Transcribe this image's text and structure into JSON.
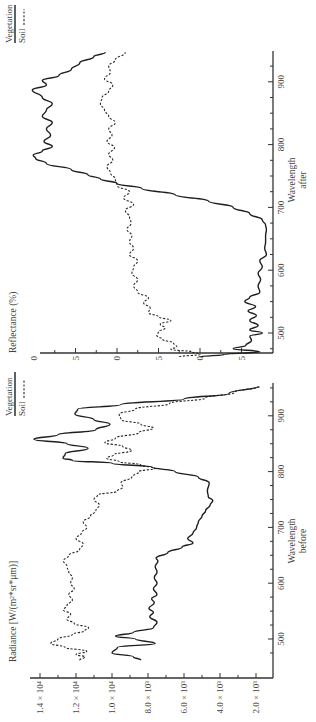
{
  "chart_data": [
    {
      "type": "line",
      "id": "before",
      "title": "",
      "xlabel": "Wavelength",
      "xlabel_sub": "before",
      "ylabel": "Radiance [W/(m²*sr*μm)]",
      "xlim": [
        460,
        955
      ],
      "ylim": [
        800,
        15000
      ],
      "xticks": [
        500,
        600,
        700,
        800,
        900
      ],
      "yticks": [
        2000,
        4000,
        6000,
        8000,
        10000,
        12000,
        14000
      ],
      "ytick_labels": [
        "2.0 × 10³",
        "4.0 × 10³",
        "6.0 × 10³",
        "8.0 × 10³",
        "1.0 × 10⁴",
        "1.2 × 10⁴",
        "1.4 × 10⁴"
      ],
      "legend": [
        {
          "name": "Vegetation",
          "style": "solid"
        },
        {
          "name": "Soil",
          "style": "dashed"
        }
      ],
      "series": [
        {
          "name": "Vegetation",
          "style": "solid",
          "x": [
            462,
            468,
            475,
            485,
            492,
            500,
            505,
            512,
            520,
            530,
            540,
            548,
            555,
            565,
            572,
            580,
            590,
            600,
            610,
            620,
            630,
            640,
            645,
            655,
            665,
            672,
            680,
            690,
            700,
            710,
            720,
            730,
            740,
            748,
            755,
            765,
            780,
            790,
            800,
            808,
            815,
            820,
            824,
            832,
            842,
            850,
            858,
            866,
            875,
            885,
            893,
            903,
            912,
            920,
            930,
            940,
            953
          ],
          "y": [
            8400,
            8800,
            10000,
            9700,
            7600,
            8700,
            9800,
            8800,
            7700,
            7500,
            7900,
            7700,
            7950,
            7650,
            7800,
            7500,
            7700,
            7500,
            7650,
            7500,
            7600,
            7450,
            7550,
            6900,
            6100,
            5500,
            5800,
            5500,
            5300,
            5200,
            5000,
            4800,
            4550,
            4400,
            4650,
            4700,
            4600,
            5200,
            6500,
            7800,
            10000,
            12200,
            12720,
            12600,
            11330,
            12500,
            14340,
            13000,
            10900,
            10110,
            11000,
            12060,
            11900,
            9500,
            6000,
            3500,
            1880
          ]
        },
        {
          "name": "Soil",
          "style": "dashed",
          "x": [
            462,
            468,
            472,
            478,
            485,
            492,
            500,
            508,
            515,
            520,
            528,
            535,
            545,
            552,
            560,
            570,
            580,
            590,
            600,
            610,
            620,
            630,
            640,
            650,
            660,
            670,
            680,
            690,
            700,
            710,
            720,
            730,
            740,
            750,
            758,
            765,
            772,
            780,
            790,
            800,
            806,
            812,
            818,
            824,
            830,
            838,
            845,
            852,
            860,
            870,
            878,
            885,
            893,
            903,
            912,
            922,
            932,
            942,
            953
          ],
          "y": [
            11800,
            11500,
            12000,
            11400,
            12600,
            13400,
            13000,
            12200,
            11500,
            11300,
            12100,
            12500,
            12300,
            12700,
            12500,
            12200,
            12400,
            12100,
            12300,
            12200,
            12400,
            12500,
            12700,
            12400,
            11800,
            11600,
            12000,
            11700,
            11400,
            11600,
            11200,
            10900,
            10700,
            11000,
            10800,
            9700,
            9400,
            9500,
            8900,
            8500,
            7600,
            8400,
            9600,
            10300,
            9900,
            8900,
            9400,
            10400,
            9800,
            8500,
            7700,
            8400,
            9500,
            9600,
            8700,
            6800,
            4800,
            3200,
            1800
          ]
        }
      ]
    },
    {
      "type": "line",
      "id": "after",
      "title": "",
      "xlabel": "Wavelength",
      "xlabel_sub": "after",
      "ylabel": "Reflectance (%)",
      "xlim": [
        460,
        955
      ],
      "ylim": [
        0.117,
        0.42
      ],
      "xticks": [
        500,
        600,
        700,
        800,
        900
      ],
      "yticks": [
        0.15,
        0.2,
        0.25,
        0.3,
        0.35,
        0.4
      ],
      "ytick_labels": [
        "0.15",
        "0.20",
        "0.25",
        "0.30",
        "0.35",
        "0.40"
      ],
      "legend": [
        {
          "name": "Vegetation",
          "style": "solid"
        },
        {
          "name": "Soil",
          "style": "dashed"
        }
      ],
      "series": [
        {
          "name": "Vegetation",
          "style": "solid",
          "x": [
            462,
            466,
            470,
            475,
            480,
            488,
            495,
            500,
            505,
            512,
            520,
            528,
            535,
            542,
            550,
            557,
            565,
            575,
            585,
            595,
            605,
            615,
            625,
            635,
            645,
            655,
            665,
            672,
            680,
            690,
            700,
            710,
            720,
            730,
            738,
            745,
            752,
            760,
            770,
            778,
            783,
            790,
            797,
            805,
            815,
            825,
            835,
            845,
            855,
            865,
            875,
            887,
            895,
            902,
            910,
            920,
            930,
            940,
            947
          ],
          "y": [
            0.2,
            0.17,
            0.128,
            0.16,
            0.145,
            0.138,
            0.14,
            0.125,
            0.14,
            0.13,
            0.14,
            0.132,
            0.142,
            0.133,
            0.146,
            0.14,
            0.128,
            0.13,
            0.127,
            0.13,
            0.125,
            0.128,
            0.12,
            0.122,
            0.121,
            0.121,
            0.12,
            0.121,
            0.125,
            0.14,
            0.16,
            0.19,
            0.23,
            0.27,
            0.3,
            0.32,
            0.335,
            0.355,
            0.385,
            0.398,
            0.401,
            0.39,
            0.378,
            0.388,
            0.38,
            0.385,
            0.378,
            0.39,
            0.385,
            0.378,
            0.39,
            0.402,
            0.385,
            0.39,
            0.37,
            0.355,
            0.345,
            0.328,
            0.314
          ]
        },
        {
          "name": "Soil",
          "style": "dashed",
          "x": [
            462,
            466,
            470,
            474,
            478,
            484,
            490,
            496,
            502,
            508,
            514,
            520,
            526,
            532,
            540,
            548,
            556,
            565,
            575,
            585,
            595,
            605,
            615,
            625,
            635,
            645,
            655,
            665,
            675,
            685,
            695,
            705,
            715,
            725,
            735,
            745,
            755,
            765,
            775,
            785,
            795,
            805,
            815,
            825,
            835,
            845,
            855,
            865,
            875,
            885,
            895,
            905,
            915,
            925,
            935,
            947
          ],
          "y": [
            0.225,
            0.2,
            0.21,
            0.235,
            0.228,
            0.232,
            0.245,
            0.252,
            0.25,
            0.242,
            0.248,
            0.235,
            0.25,
            0.262,
            0.26,
            0.268,
            0.262,
            0.275,
            0.28,
            0.275,
            0.282,
            0.28,
            0.275,
            0.285,
            0.28,
            0.285,
            0.282,
            0.288,
            0.283,
            0.285,
            0.29,
            0.28,
            0.292,
            0.285,
            0.3,
            0.302,
            0.308,
            0.312,
            0.305,
            0.31,
            0.303,
            0.312,
            0.306,
            0.31,
            0.302,
            0.31,
            0.315,
            0.32,
            0.318,
            0.31,
            0.305,
            0.315,
            0.308,
            0.31,
            0.302,
            0.29
          ]
        }
      ]
    }
  ],
  "labels": {
    "after": {
      "ylabel": "Reflectance (%)",
      "xlabel": "Wavelength",
      "xlabel_sub": "after",
      "legend_veg": "Vegetation",
      "legend_soil": "Soil"
    },
    "before": {
      "ylabel": "Radiance [W/(m²*sr*μm)]",
      "xlabel": "Wavelength",
      "xlabel_sub": "before",
      "legend_veg": "Vegetation",
      "legend_soil": "Soil"
    }
  }
}
